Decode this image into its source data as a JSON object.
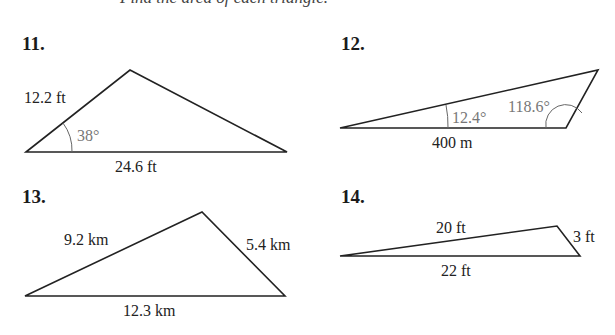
{
  "header": {
    "cutoff_text": "Find the area of each triangle."
  },
  "problems": [
    {
      "number": "11.",
      "labels": {
        "side_a": "12.2 ft",
        "angle": "38°",
        "base": "24.6 ft"
      }
    },
    {
      "number": "12.",
      "labels": {
        "angle_left": "12.4°",
        "angle_right": "118.6°",
        "base": "400 m"
      }
    },
    {
      "number": "13.",
      "labels": {
        "side_left": "9.2 km",
        "side_right": "5.4 km",
        "base": "12.3 km"
      }
    },
    {
      "number": "14.",
      "labels": {
        "side_top": "20 ft",
        "side_right": "3 ft",
        "base": "22 ft"
      }
    }
  ]
}
